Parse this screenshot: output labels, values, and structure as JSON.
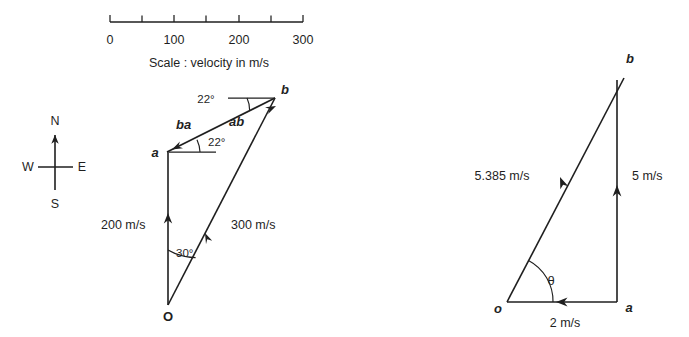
{
  "figure": {
    "background_color": "#ffffff",
    "ink_color": "#1f1f1f"
  },
  "scale_bar": {
    "caption": "Scale : velocity in m/s",
    "unit": "m/s",
    "major_labels": [
      "0",
      "100",
      "200",
      "300"
    ],
    "major_values": [
      0,
      100,
      200,
      300
    ],
    "minor_values": [
      50,
      150,
      250
    ],
    "tick_step": 50,
    "range": [
      0,
      300
    ]
  },
  "compass": {
    "north": "N",
    "south": "S",
    "east": "E",
    "west": "W",
    "arrow_direction": "north"
  },
  "velocity_diagram": {
    "points": {
      "origin": "O",
      "a": "a",
      "b": "b"
    },
    "vectors": [
      {
        "name": "oa",
        "label": "200 m/s",
        "magnitude": 200,
        "unit": "m/s"
      },
      {
        "name": "ob",
        "label": "300 m/s",
        "magnitude": 300,
        "unit": "m/s"
      },
      {
        "name": "ba",
        "label": "ba"
      },
      {
        "name": "ab",
        "label": "ab"
      }
    ],
    "angles": [
      {
        "name": "angle-at-origin",
        "label": "30°",
        "value": 30
      },
      {
        "name": "angle-at-a",
        "label": "22°",
        "value": 22
      },
      {
        "name": "angle-at-b",
        "label": "22°",
        "value": 22
      }
    ]
  },
  "relative_velocity_triangle": {
    "points": {
      "origin": "o",
      "a": "a",
      "b": "b"
    },
    "vectors": [
      {
        "name": "oa",
        "label": "2 m/s",
        "magnitude": 2,
        "unit": "m/s"
      },
      {
        "name": "ab",
        "label": "5 m/s",
        "magnitude": 5,
        "unit": "m/s"
      },
      {
        "name": "ob",
        "label": "5.385 m/s",
        "magnitude": 5.385,
        "unit": "m/s"
      }
    ],
    "angles": [
      {
        "name": "theta",
        "label": "θ"
      }
    ]
  }
}
